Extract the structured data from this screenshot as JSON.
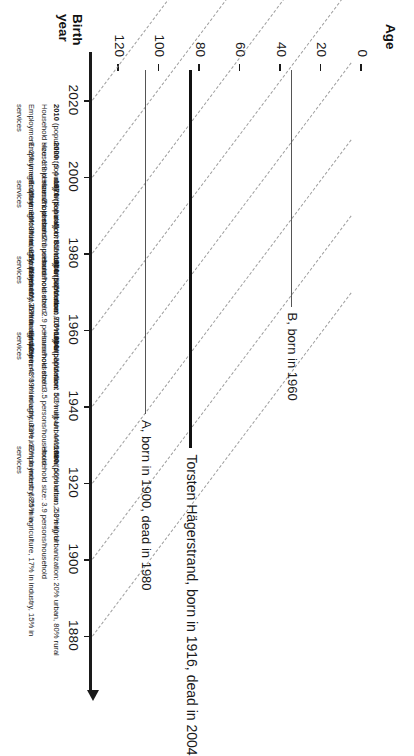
{
  "figure": {
    "birth_axis_title": "Birth\nyear",
    "age_axis_title": "Age"
  },
  "chart_data": {
    "type": "line",
    "xlabel": "Age",
    "ylabel": "Birth year",
    "x": [
      0,
      20,
      40,
      60,
      80,
      100,
      120
    ],
    "xlim": [
      0,
      130
    ],
    "ylim": [
      1870,
      2030
    ],
    "grid": false,
    "legend": "none",
    "age_ticks": [
      "0",
      "20",
      "40",
      "60",
      "80",
      "100",
      "120"
    ],
    "birth_year_ticks": [
      "2020",
      "2000",
      "1980",
      "1960",
      "1940",
      "1920",
      "1900",
      "1880"
    ],
    "series": [
      {
        "name": "A, born in 1900, dead in 1980",
        "birth_year": 1900,
        "age_start": 0,
        "age_end": 80,
        "style": "thin",
        "label": "A, born in 1900, dead in 1980"
      },
      {
        "name": "Torsten Hägerstrand, born in 1916, dead in 2004",
        "birth_year": 1916,
        "age_start": 0,
        "age_end": 88,
        "style": "thick",
        "label": "Torsten Hägerstrand, born in 1916, dead in 2004"
      },
      {
        "name": "B, born in 1960",
        "birth_year": 1960,
        "age_start": 0,
        "age_end": 55,
        "style": "thin",
        "label": "B, born in 1960"
      }
    ],
    "cohort_diagonals": [
      1880,
      1900,
      1920,
      1940,
      1960,
      1980,
      2000,
      2020
    ],
    "annotations": [
      "A, born in 1900, dead in 1980",
      "Torsten Hägerstrand, born in 1916, dead in 2004",
      "B, born in 1960"
    ]
  },
  "decades": [
    {
      "year": "2010",
      "line1_rest": " (population: 9.4 milj) Urbanization: 85% urban, 15% rural",
      "line2": "Household size: 1.9 persons/household",
      "line3": "Employment: 2% in agriculture, 20% in industry, 78% in",
      "line4": "services"
    },
    {
      "year": "2000",
      "line1_rest": " (population: 8.8 milj) Urbanization: 84% urban, 16% rural",
      "line2": "Household size: 2.1 persons/household",
      "line3": "Employment: 2% in agriculture, 25% in industry, 73% in services",
      "line4": ""
    },
    {
      "year": "1970",
      "line1_rest": " (population: 8.1 milj) Urbanization: 80% urban, 20% rural",
      "line2": "Household size: 2.6 persons/household",
      "line3": "Employment: 8% in agriculture, 40% in industry, 52% in",
      "line4": "services"
    },
    {
      "year": "1950",
      "line1_rest": " (population: 7.0 milj) Urbanization: 56% urban, 44% rural",
      "line2": "Household size: 2.9 persons/household",
      "line3": "Employment: 25% in agriculture, 43% in industry, 33% in",
      "line4": "services"
    },
    {
      "year": "1930",
      "line1_rest": " (population: 6.1 milj) Urbanization: 50% urban, 50% rural",
      "line2": "Household size: 3.5 persons/household",
      "line3": "Employment: 39% in agriculture, 36% in industry, 25% in",
      "line4": "services"
    },
    {
      "year": "1880",
      "line1_rest": " (population: 2.3 milj) Urbanization: 20% urban, 80% rural",
      "line2": "Household size: 3.9 persons/household",
      "line3": "Employment: 68% in agriculture, 17% in industry, 15% in",
      "line4": "services"
    }
  ],
  "caption": ""
}
